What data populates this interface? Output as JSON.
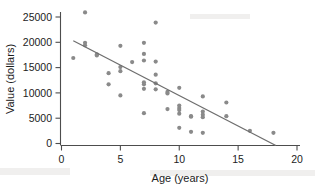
{
  "chart_data": {
    "type": "scatter",
    "title": "",
    "xlabel": "Age (years)",
    "ylabel": "Value (dollars)",
    "xlim": [
      0,
      20
    ],
    "ylim": [
      0,
      27000
    ],
    "xticks": [
      0,
      5,
      10,
      15,
      20
    ],
    "yticks": [
      0,
      5000,
      10000,
      15000,
      20000,
      25000
    ],
    "xtick_labels": [
      "0",
      "5",
      "10",
      "15",
      "20"
    ],
    "ytick_labels": [
      "0",
      "5000",
      "10000",
      "15000",
      "20000",
      "25000"
    ],
    "grid": false,
    "legend": "none",
    "point_color": "#8a8a8a",
    "line_color": "#6e6e6e",
    "axis_color": "#4d4d4d",
    "background_color": "#ffffff",
    "series": [
      {
        "name": "Vehicles",
        "marker": "circle",
        "points": [
          {
            "x": 1,
            "y": 16900
          },
          {
            "x": 2,
            "y": 25900
          },
          {
            "x": 2,
            "y": 19900
          },
          {
            "x": 2,
            "y": 19400
          },
          {
            "x": 3,
            "y": 17600
          },
          {
            "x": 3,
            "y": 17400
          },
          {
            "x": 4,
            "y": 13900
          },
          {
            "x": 4,
            "y": 11700
          },
          {
            "x": 5,
            "y": 19300
          },
          {
            "x": 5,
            "y": 15100
          },
          {
            "x": 5,
            "y": 14300
          },
          {
            "x": 5,
            "y": 9500
          },
          {
            "x": 6,
            "y": 16100
          },
          {
            "x": 7,
            "y": 19900
          },
          {
            "x": 7,
            "y": 17700
          },
          {
            "x": 7,
            "y": 16400
          },
          {
            "x": 7,
            "y": 12100
          },
          {
            "x": 7,
            "y": 11700
          },
          {
            "x": 7,
            "y": 10800
          },
          {
            "x": 7,
            "y": 6000
          },
          {
            "x": 8,
            "y": 23900
          },
          {
            "x": 8,
            "y": 16200
          },
          {
            "x": 8,
            "y": 13600
          },
          {
            "x": 8,
            "y": 11900
          },
          {
            "x": 8,
            "y": 10700
          },
          {
            "x": 9,
            "y": 10200
          },
          {
            "x": 9,
            "y": 9900
          },
          {
            "x": 9,
            "y": 6800
          },
          {
            "x": 10,
            "y": 11000
          },
          {
            "x": 10,
            "y": 7500
          },
          {
            "x": 10,
            "y": 7000
          },
          {
            "x": 10,
            "y": 6600
          },
          {
            "x": 10,
            "y": 5900
          },
          {
            "x": 10,
            "y": 3100
          },
          {
            "x": 11,
            "y": 5400
          },
          {
            "x": 11,
            "y": 5300
          },
          {
            "x": 11,
            "y": 2300
          },
          {
            "x": 12,
            "y": 9300
          },
          {
            "x": 12,
            "y": 6300
          },
          {
            "x": 12,
            "y": 5700
          },
          {
            "x": 12,
            "y": 5200
          },
          {
            "x": 12,
            "y": 2100
          },
          {
            "x": 14,
            "y": 8100
          },
          {
            "x": 14,
            "y": 5400
          },
          {
            "x": 16,
            "y": 2500
          },
          {
            "x": 18,
            "y": 2100
          }
        ]
      }
    ],
    "trendline": {
      "name": "least-squares-line",
      "x_start": 1.0,
      "y_start": 20300,
      "x_end": 18.2,
      "y_end": -400
    }
  }
}
